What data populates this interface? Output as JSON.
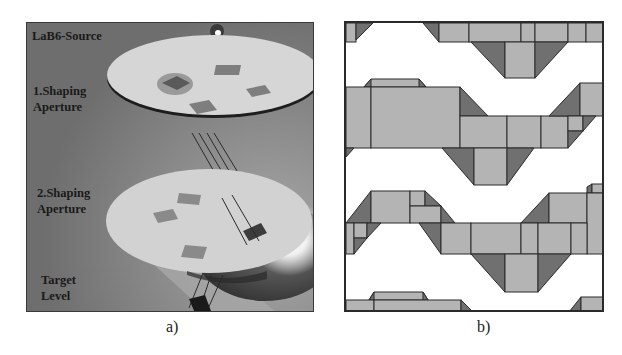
{
  "figure": {
    "panel_a": {
      "caption": "a)",
      "labels": {
        "source": "LaB6-Source",
        "aperture1_line1": "1.Shaping",
        "aperture1_line2": "Aperture",
        "aperture2_line1": "2.Shaping",
        "aperture2_line2": "Aperture",
        "target_line1": "Target",
        "target_line2": "Level"
      },
      "colors": {
        "background": "#7c7c7c",
        "disc": "#d8d8d8",
        "aperture_hole": "#8a8a8a",
        "beam": "#2a2a2a"
      }
    },
    "panel_b": {
      "caption": "b)",
      "colors": {
        "rect_fill": "#b4b4b4",
        "triangle_fill": "#707070",
        "stroke": "#2a2a2a",
        "background": "#ffffff"
      }
    }
  }
}
